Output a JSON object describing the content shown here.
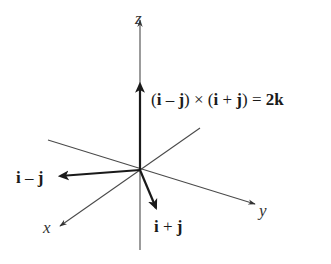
{
  "diagram": {
    "type": "3d-vector-cross-product",
    "axes": {
      "x": {
        "label": "x"
      },
      "y": {
        "label": "y"
      },
      "z": {
        "label": "z"
      }
    },
    "vectors": [
      {
        "name": "i-minus-j",
        "label": "i – j"
      },
      {
        "name": "i-plus-j",
        "label": "i + j"
      },
      {
        "name": "cross-product",
        "label": "(i – j) × (i + j) = 2k"
      }
    ],
    "equation": {
      "open1": "(",
      "i1": "i",
      "minus": " – ",
      "j1": "j",
      "close1": ")",
      "times": " × ",
      "open2": "(",
      "i2": "i",
      "plus": " + ",
      "j2": "j",
      "close2": ")",
      "equals": " = ",
      "coef": "2",
      "k": "k"
    },
    "label_i_minus_j": {
      "i": "i",
      "op": " – ",
      "j": "j"
    },
    "label_i_plus_j": {
      "i": "i",
      "op": " + ",
      "j": "j"
    }
  }
}
